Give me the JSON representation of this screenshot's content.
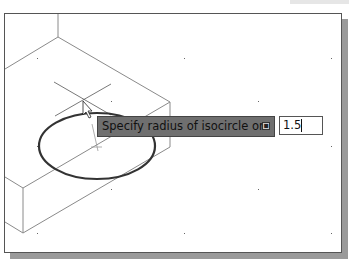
{
  "prompt": {
    "text": "Specify radius of isocircle or",
    "options_icon": "down-arrow-options-icon",
    "input_value": "1.5"
  },
  "drawing": {
    "object": "isometric-box",
    "isocircle": "ellipse",
    "cursor": "crosshair-pointer"
  },
  "colors": {
    "tooltip_bg": "#6f6f6f",
    "lines": "#8a8a8a",
    "ellipse": "#333333",
    "shadow": "#9a9a9a"
  }
}
